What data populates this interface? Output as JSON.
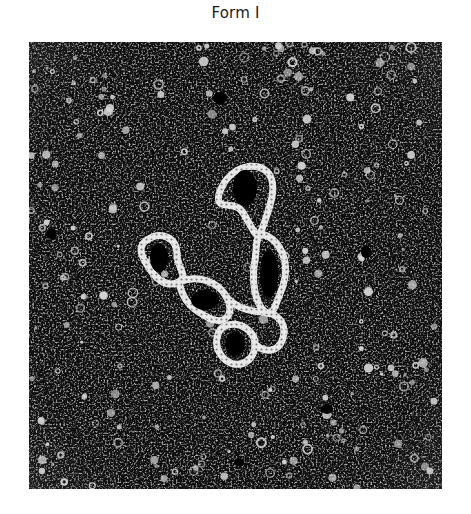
{
  "figure": {
    "title": "Form I",
    "image": {
      "description": "Electron micrograph of supercoiled (Form I) circular DNA on a grainy dark background",
      "background_color": "#0d0d0d",
      "particle_color": "#d8d8d8",
      "strand_color": "#e6e6e6"
    }
  }
}
